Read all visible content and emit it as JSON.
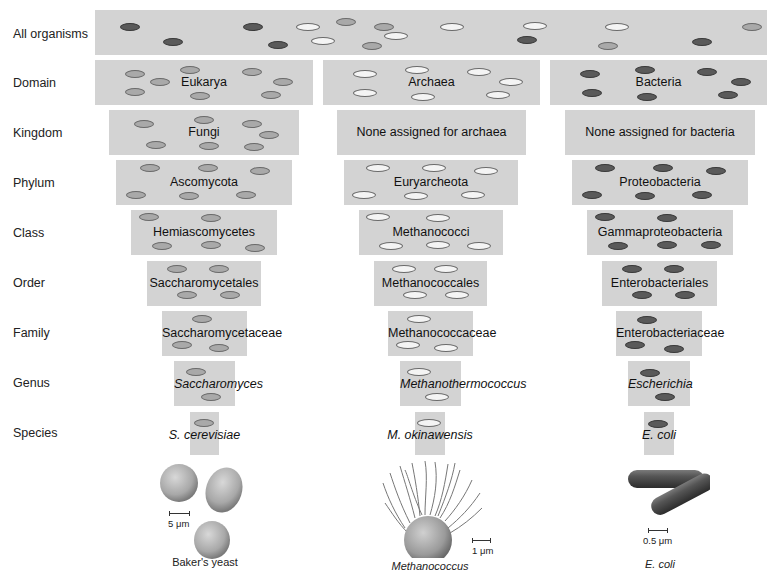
{
  "ranks": [
    "All organisms",
    "Domain",
    "Kingdom",
    "Phylum",
    "Class",
    "Order",
    "Family",
    "Genus",
    "Species"
  ],
  "colors": {
    "eukarya": "#a9a9a9",
    "archaea": "#f4f4f4",
    "bacteria": "#5a5a5a",
    "box": "#d3d3d3"
  },
  "columns": {
    "yeast": {
      "domain": "Eukarya",
      "kingdom": "Fungi",
      "phylum": "Ascomycota",
      "class": "Hemiascomycetes",
      "order": "Saccharomycetales",
      "family": "Saccharomycetaceae",
      "genus": "Saccharomyces",
      "species": "S. cerevisiae",
      "illustration": "yeast-cells",
      "scale": "5 μm",
      "caption": "Baker's yeast"
    },
    "archaea": {
      "domain": "Archaea",
      "kingdom": "None assigned for archaea",
      "phylum": "Euryarcheota",
      "class": "Methanococci",
      "order": "Methanococcales",
      "family": "Methanococcaceae",
      "genus": "Methanothermococcus",
      "species": "M. okinawensis",
      "illustration": "methanococcus-cell",
      "scale": "1 μm",
      "caption": "Methanococcus"
    },
    "bacteria": {
      "domain": "Bacteria",
      "kingdom": "None assigned for bacteria",
      "phylum": "Proteobacteria",
      "class": "Gammaproteobacteria",
      "order": "Enterobacteriales",
      "family": "Enterobacteriaceae",
      "genus": "Escherichia",
      "species": "E. coli",
      "illustration": "e-coli-rods",
      "scale": "0.5 μm",
      "caption": "E. coli"
    }
  }
}
